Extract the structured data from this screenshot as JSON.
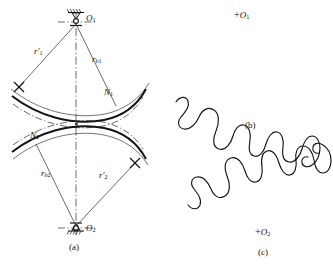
{
  "figure": {
    "title_present": false,
    "panels": [
      {
        "id": "a",
        "caption": "(a)",
        "description": "geometric construction of conjugate tooth profiles about centers O1 and O2"
      },
      {
        "id": "b",
        "caption": "(b)",
        "description": "generated wavy tooth profile for gear 1"
      },
      {
        "id": "c",
        "caption": "(c)",
        "description": "generated wavy tooth profile for gear 2"
      }
    ]
  },
  "panel_a": {
    "caption": "(a)",
    "centers": [
      {
        "name": "O1",
        "letter": "O",
        "sub": "1",
        "support": "fixed-pivot-ground-top"
      },
      {
        "name": "O2",
        "letter": "O",
        "sub": "2",
        "support": "fixed-pivot-ground-bottom"
      }
    ],
    "labels": [
      {
        "id": "r1-prime",
        "letter": "r",
        "prime": "′",
        "sub": "1",
        "text": "r′1"
      },
      {
        "id": "rb1",
        "letter": "r",
        "prime": "",
        "sub": "b1",
        "text": "rb1"
      },
      {
        "id": "N1",
        "letter": "N",
        "prime": "",
        "sub": "1",
        "text": "N1"
      },
      {
        "id": "C",
        "letter": "C",
        "prime": "",
        "sub": "",
        "text": "C"
      },
      {
        "id": "N2",
        "letter": "N",
        "prime": "",
        "sub": "2",
        "text": "N2"
      },
      {
        "id": "rb2",
        "letter": "r",
        "prime": "",
        "sub": "b2",
        "text": "rb2"
      },
      {
        "id": "r2-prime",
        "letter": "r",
        "prime": "′",
        "sub": "2",
        "text": "r′2"
      }
    ],
    "line_styles": {
      "center_line": "dash-dot",
      "profile_curve": "solid-thick",
      "pitch_arc": "solid-thin",
      "base_arc": "dash-dot-thin",
      "radius_line": "solid-thin"
    },
    "tick_marks": [
      {
        "id": "tick-left",
        "shape": "x-cross"
      },
      {
        "id": "tick-right",
        "shape": "x-cross"
      }
    ]
  },
  "panel_b": {
    "caption": "(b)",
    "center_marker": {
      "plus": "+",
      "letter": "O",
      "sub": "1"
    },
    "curve": "wavy-tooth-profile-downward-lobes"
  },
  "panel_c": {
    "caption": "(c)",
    "center_marker": {
      "plus": "+",
      "letter": "O",
      "sub": "2"
    },
    "curve": "wavy-tooth-profile-upward-lobes"
  },
  "colors": {
    "ink": "#141414",
    "background": "#ffffff",
    "thin_line": "#3a3a3a"
  }
}
